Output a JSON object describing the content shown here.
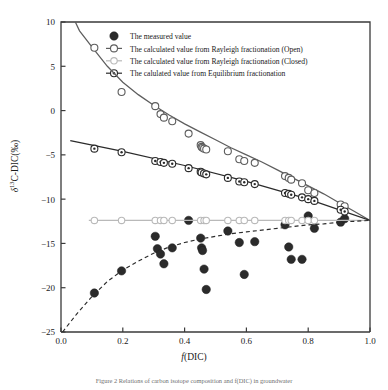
{
  "figure": {
    "caption": "Figure 2  Relations of carbon isotope composition and f(DIC) in groundwater"
  },
  "chart_data": {
    "type": "scatter",
    "title": "",
    "xlabel": "f(DIC)",
    "ylabel": "δ13C-DIC(‰)",
    "ylabel_delta": "δ",
    "ylabel_sup": "13",
    "ylabel_rest": "C-DIC(‰)",
    "xlabel_italic": "f",
    "xlabel_rest": "(DIC)",
    "xlim": [
      0.0,
      1.0
    ],
    "ylim": [
      -25,
      10
    ],
    "xticks": [
      "0.0",
      "0.2",
      "0.4",
      "0.6",
      "0.8",
      "1.0"
    ],
    "xtick_values": [
      0.0,
      0.2,
      0.4,
      0.6,
      0.8,
      1.0
    ],
    "yticks": [
      "10",
      "5",
      "0",
      "-5",
      "-10",
      "-15",
      "-20",
      "-25"
    ],
    "ytick_values": [
      10,
      5,
      0,
      -5,
      -10,
      -15,
      -20,
      -25
    ],
    "grid": false,
    "legend_position": "top-center",
    "legend": [
      {
        "label": "The measured value",
        "marker": "filled-circle",
        "color": "#2b2b2b",
        "line": "none"
      },
      {
        "label": "The calculated value from Rayleigh fractionation (Open)",
        "marker": "open-circle",
        "color": "#5d5d5d",
        "line": "solid"
      },
      {
        "label": "The calculated value from Rayleigh fractionation (Closed)",
        "marker": "light-square",
        "color": "#b9b9b9",
        "line": "solid"
      },
      {
        "label": "The calulated value from Equilibrium fractionation",
        "marker": "dot-circle",
        "color": "#2b2b2b",
        "line": "solid"
      }
    ],
    "series": [
      {
        "name": "The measured value",
        "marker": "filled-circle",
        "color": "#2b2b2b",
        "points": [
          [
            0.108,
            -20.6
          ],
          [
            0.196,
            -18.1
          ],
          [
            0.305,
            -14.2
          ],
          [
            0.312,
            -15.6
          ],
          [
            0.322,
            -16.2
          ],
          [
            0.333,
            -17.3
          ],
          [
            0.36,
            -15.5
          ],
          [
            0.413,
            -12.4
          ],
          [
            0.452,
            -14.4
          ],
          [
            0.455,
            -15.5
          ],
          [
            0.458,
            -15.8
          ],
          [
            0.463,
            -17.9
          ],
          [
            0.47,
            -20.2
          ],
          [
            0.54,
            -13.6
          ],
          [
            0.577,
            -14.9
          ],
          [
            0.593,
            -18.5
          ],
          [
            0.627,
            -14.8
          ],
          [
            0.725,
            -12.9
          ],
          [
            0.737,
            -15.4
          ],
          [
            0.745,
            -16.8
          ],
          [
            0.78,
            -16.8
          ],
          [
            0.8,
            -11.9
          ],
          [
            0.82,
            -13.3
          ],
          [
            0.905,
            -12.6
          ],
          [
            0.918,
            -12.2
          ]
        ]
      },
      {
        "name": "The calculated value from Rayleigh fractionation (Open)",
        "marker": "open-circle",
        "color": "#5d5d5d",
        "line": "solid",
        "curve": [
          [
            0.03,
            11.2
          ],
          [
            0.06,
            9.0
          ],
          [
            0.1,
            7.2
          ],
          [
            0.15,
            5.0
          ],
          [
            0.2,
            3.2
          ],
          [
            0.25,
            1.8
          ],
          [
            0.3,
            0.6
          ],
          [
            0.35,
            -0.5
          ],
          [
            0.4,
            -1.5
          ],
          [
            0.45,
            -2.4
          ],
          [
            0.5,
            -3.3
          ],
          [
            0.55,
            -4.2
          ],
          [
            0.6,
            -5.0
          ],
          [
            0.65,
            -5.8
          ],
          [
            0.7,
            -6.7
          ],
          [
            0.75,
            -7.6
          ],
          [
            0.8,
            -8.5
          ],
          [
            0.85,
            -9.4
          ],
          [
            0.9,
            -10.4
          ],
          [
            0.95,
            -11.4
          ],
          [
            1.0,
            -12.4
          ]
        ],
        "points": [
          [
            0.108,
            7.1
          ],
          [
            0.196,
            2.1
          ],
          [
            0.305,
            0.5
          ],
          [
            0.322,
            -0.4
          ],
          [
            0.333,
            -0.8
          ],
          [
            0.36,
            -1.2
          ],
          [
            0.413,
            -2.6
          ],
          [
            0.452,
            -3.9
          ],
          [
            0.455,
            -4.1
          ],
          [
            0.458,
            -4.2
          ],
          [
            0.463,
            -4.3
          ],
          [
            0.47,
            -4.4
          ],
          [
            0.54,
            -4.6
          ],
          [
            0.577,
            -5.5
          ],
          [
            0.593,
            -5.7
          ],
          [
            0.627,
            -5.9
          ],
          [
            0.725,
            -7.4
          ],
          [
            0.737,
            -7.6
          ],
          [
            0.745,
            -7.8
          ],
          [
            0.78,
            -8.2
          ],
          [
            0.8,
            -9.0
          ],
          [
            0.82,
            -9.3
          ],
          [
            0.905,
            -10.6
          ],
          [
            0.918,
            -10.8
          ]
        ]
      },
      {
        "name": "The calculated value from Rayleigh fractionation (Closed)",
        "marker": "light-square",
        "color": "#b9b9b9",
        "line": "solid",
        "curve": [
          [
            0.09,
            -12.4
          ],
          [
            1.0,
            -12.4
          ]
        ],
        "points": [
          [
            0.108,
            -12.4
          ],
          [
            0.196,
            -12.4
          ],
          [
            0.305,
            -12.4
          ],
          [
            0.322,
            -12.4
          ],
          [
            0.333,
            -12.4
          ],
          [
            0.36,
            -12.4
          ],
          [
            0.452,
            -12.4
          ],
          [
            0.463,
            -12.4
          ],
          [
            0.47,
            -12.4
          ],
          [
            0.54,
            -12.4
          ],
          [
            0.577,
            -12.4
          ],
          [
            0.593,
            -12.4
          ],
          [
            0.627,
            -12.4
          ],
          [
            0.725,
            -12.4
          ],
          [
            0.737,
            -12.4
          ],
          [
            0.745,
            -12.4
          ],
          [
            0.78,
            -12.4
          ],
          [
            0.8,
            -12.4
          ],
          [
            0.82,
            -12.4
          ]
        ]
      },
      {
        "name": "The calulated value from Equilibrium fractionation",
        "marker": "dot-circle",
        "color": "#2b2b2b",
        "line": "solid",
        "curve": [
          [
            0.03,
            -3.4
          ],
          [
            0.2,
            -4.6
          ],
          [
            0.4,
            -6.2
          ],
          [
            0.6,
            -8.0
          ],
          [
            0.8,
            -10.0
          ],
          [
            1.0,
            -12.4
          ]
        ],
        "points": [
          [
            0.108,
            -4.3
          ],
          [
            0.196,
            -4.7
          ],
          [
            0.305,
            -5.7
          ],
          [
            0.322,
            -5.8
          ],
          [
            0.333,
            -5.9
          ],
          [
            0.36,
            -6.0
          ],
          [
            0.413,
            -6.5
          ],
          [
            0.452,
            -6.9
          ],
          [
            0.455,
            -7.0
          ],
          [
            0.463,
            -7.1
          ],
          [
            0.47,
            -7.2
          ],
          [
            0.54,
            -7.6
          ],
          [
            0.577,
            -8.0
          ],
          [
            0.593,
            -8.1
          ],
          [
            0.627,
            -8.3
          ],
          [
            0.725,
            -9.3
          ],
          [
            0.737,
            -9.4
          ],
          [
            0.745,
            -9.5
          ],
          [
            0.78,
            -9.8
          ],
          [
            0.8,
            -10.0
          ],
          [
            0.82,
            -10.2
          ],
          [
            0.905,
            -11.2
          ],
          [
            0.918,
            -11.4
          ]
        ]
      },
      {
        "name": "dashed-lower-envelope",
        "marker": "none",
        "color": "#2b2b2b",
        "line": "dashed",
        "curve": [
          [
            0.005,
            -25.0
          ],
          [
            0.05,
            -23.0
          ],
          [
            0.1,
            -21.0
          ],
          [
            0.15,
            -19.3
          ],
          [
            0.2,
            -18.0
          ],
          [
            0.25,
            -17.0
          ],
          [
            0.3,
            -16.1
          ],
          [
            0.35,
            -15.4
          ],
          [
            0.4,
            -14.9
          ],
          [
            0.45,
            -14.5
          ],
          [
            0.5,
            -14.2
          ],
          [
            0.55,
            -13.9
          ],
          [
            0.6,
            -13.7
          ],
          [
            0.65,
            -13.5
          ],
          [
            0.7,
            -13.3
          ],
          [
            0.75,
            -13.1
          ],
          [
            0.8,
            -12.9
          ],
          [
            0.85,
            -12.8
          ],
          [
            0.9,
            -12.6
          ],
          [
            0.95,
            -12.5
          ],
          [
            1.0,
            -12.4
          ]
        ]
      }
    ]
  }
}
